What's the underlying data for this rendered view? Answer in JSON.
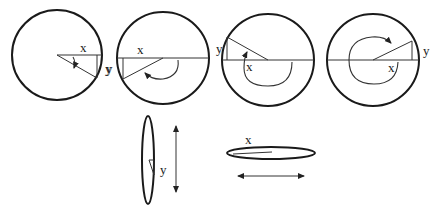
{
  "diagram": {
    "stroke_color": "#1a1a1a",
    "background": "#ffffff",
    "circles": [
      {
        "id": "circle-1",
        "center": [
          57,
          55
        ],
        "radius": 45,
        "angle_deg": -28,
        "rotation_arrow": "small clockwise arc below radius",
        "x_label": "x",
        "y_label": "y"
      },
      {
        "id": "circle-2",
        "center": [
          163,
          58
        ],
        "radius": 46,
        "angle_deg": -155,
        "rotation_arrow": "clockwise arc through lower half",
        "x_label": "x",
        "y_label": "y"
      },
      {
        "id": "circle-3",
        "center": [
          268,
          60
        ],
        "radius": 46,
        "angle_deg": 150,
        "rotation_arrow": "clockwise arc from right through bottom to left-top",
        "x_label": "x",
        "y_label": "y"
      },
      {
        "id": "circle-4",
        "center": [
          373,
          60
        ],
        "radius": 46,
        "angle_deg": 25,
        "rotation_arrow": "nearly full clockwise loop",
        "x_label": "x",
        "y_label": "y"
      }
    ],
    "vertical_ellipse": {
      "center": [
        148,
        170
      ],
      "rx": 6,
      "ry": 44,
      "label": "y",
      "arrow": "double-headed vertical"
    },
    "horizontal_ellipse": {
      "center": [
        270,
        153
      ],
      "rx": 44,
      "ry": 6,
      "label": "x",
      "arrow": "double-headed horizontal"
    }
  }
}
